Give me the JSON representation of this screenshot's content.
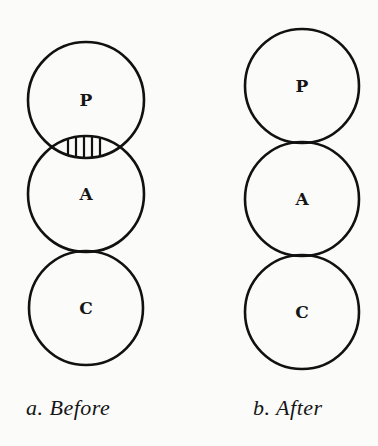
{
  "diagram": {
    "panels": [
      {
        "id": "a",
        "caption": "a.  Before",
        "circles": [
          {
            "label": "P",
            "cx": 86,
            "cy": 100,
            "r": 58
          },
          {
            "label": "A",
            "cx": 86,
            "cy": 194,
            "r": 58
          },
          {
            "label": "C",
            "cx": 86,
            "cy": 308,
            "r": 57
          }
        ],
        "overlap": {
          "between": [
            "P",
            "A"
          ],
          "style": "vertical-hatch"
        }
      },
      {
        "id": "b",
        "caption": "b.  After",
        "circles": [
          {
            "label": "P",
            "cx": 302,
            "cy": 86,
            "r": 57
          },
          {
            "label": "A",
            "cx": 302,
            "cy": 199,
            "r": 57
          },
          {
            "label": "C",
            "cx": 302,
            "cy": 312,
            "r": 57
          }
        ],
        "overlap": null
      }
    ],
    "colors": {
      "stroke": "#111111",
      "background": "#fbfbfa"
    }
  }
}
